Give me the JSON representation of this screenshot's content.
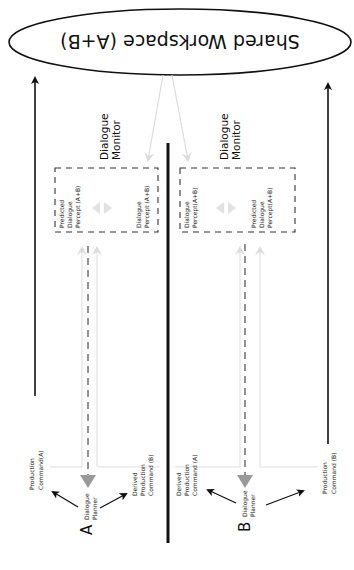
{
  "workspace": {
    "label": "Shared Workspace (A+B)"
  },
  "left": {
    "agent_label": "A",
    "planner": [
      "Dialogue",
      "Planner"
    ],
    "monitor": [
      "Dialogue",
      "Monitor"
    ],
    "predicted_percept": [
      "Predicted",
      "Dialogue",
      "Percept (A+B)"
    ],
    "percept": [
      "Dialogue",
      "Percept (A+B)"
    ],
    "production_command": [
      "Production",
      "Command(A)"
    ],
    "derived_command": [
      "Derived",
      "Production",
      "Command (B)"
    ]
  },
  "right": {
    "agent_label": "B",
    "planner": [
      "Dialogue",
      "Planner"
    ],
    "monitor": [
      "Dialogue",
      "Monitor"
    ],
    "predicted_percept": [
      "Predicted",
      "Dialogue",
      "Percept(A+B)"
    ],
    "percept": [
      "Dialogue",
      "Percept(A+B)"
    ],
    "production_command": [
      "Production",
      "Command (B)"
    ],
    "derived_command": [
      "Derived",
      "Production",
      "Command (A)"
    ]
  },
  "colors": {
    "line": "#111111",
    "dashed": "#555555",
    "light_arrow": "#d9d9d9",
    "planner_arrow": "#9a9a9a"
  }
}
